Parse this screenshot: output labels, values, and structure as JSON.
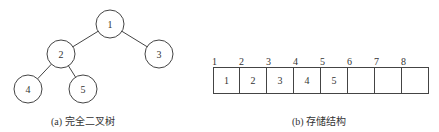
{
  "tree": {
    "caption": "(a) 完全二叉树",
    "nodes": [
      {
        "id": "1",
        "label": "1",
        "cx": 110,
        "cy": 24
      },
      {
        "id": "2",
        "label": "2",
        "cx": 61,
        "cy": 54
      },
      {
        "id": "3",
        "label": "3",
        "cx": 159,
        "cy": 54
      },
      {
        "id": "4",
        "label": "4",
        "cx": 28,
        "cy": 89
      },
      {
        "id": "5",
        "label": "5",
        "cx": 83,
        "cy": 89
      }
    ],
    "edges": [
      [
        "1",
        "2"
      ],
      [
        "1",
        "3"
      ],
      [
        "2",
        "4"
      ],
      [
        "2",
        "5"
      ]
    ]
  },
  "storage": {
    "caption": "(b) 存储结构",
    "indices": [
      "1",
      "2",
      "3",
      "4",
      "5",
      "6",
      "7",
      "8"
    ],
    "cells": [
      "1",
      "2",
      "3",
      "4",
      "5",
      "",
      "",
      ""
    ]
  }
}
